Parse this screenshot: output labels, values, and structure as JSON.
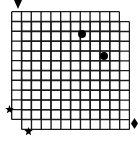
{
  "diagram": {
    "type": "lattice-overlay",
    "background_color": "#ffffff",
    "line_color": "#1a1a1a",
    "marker_color": "#000000",
    "canvas": {
      "width": 140,
      "height": 142
    },
    "grids": [
      {
        "name": "back-grid",
        "label": "back lattice",
        "x": 11,
        "y": 11,
        "cols": 11,
        "rows": 11,
        "cell": 9.8,
        "line_width": 1.35,
        "color": "#1a1a1a"
      },
      {
        "name": "front-grid",
        "label": "front lattice",
        "x": 21,
        "y": 21,
        "cols": 11,
        "rows": 11,
        "cell": 9.8,
        "line_width": 1.35,
        "color": "#1a1a1a"
      }
    ],
    "dots": [
      {
        "name": "dot-1",
        "label": "node A",
        "cx": 82,
        "cy": 34,
        "r": 4.2,
        "color": "#000000"
      },
      {
        "name": "dot-2",
        "label": "node B",
        "cx": 104,
        "cy": 56,
        "r": 4.2,
        "color": "#000000"
      }
    ],
    "stars": [
      {
        "name": "star-1",
        "label": "star left",
        "cx": 9,
        "cy": 109,
        "size": 9,
        "color": "#000000"
      },
      {
        "name": "star-2",
        "label": "star bottom-left",
        "cx": 28,
        "cy": 131,
        "size": 9,
        "color": "#000000"
      }
    ],
    "triangle": {
      "name": "triangle-top",
      "label": "top marker",
      "cx": 18,
      "cy": 4,
      "width": 8,
      "height": 9,
      "color": "#000000"
    },
    "diamond": {
      "name": "diamond-right",
      "label": "right marker",
      "cx": 134,
      "cy": 123,
      "width": 7,
      "height": 11,
      "color": "#000000"
    }
  }
}
